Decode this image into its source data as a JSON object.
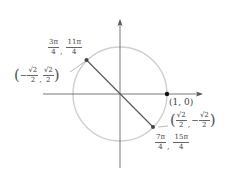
{
  "diagram": {
    "type": "unit-circle",
    "center_px": [
      120,
      94
    ],
    "radius_px": 47,
    "colors": {
      "axes": "#555555",
      "circle": "#cfcfcf",
      "chord": "#555555",
      "point": "#444444",
      "point_one_zero": "#111111"
    },
    "points": {
      "upper_left": {
        "angles": [
          {
            "num": "3π",
            "den": "4"
          },
          {
            "num": "11π",
            "den": "4"
          }
        ],
        "coords": {
          "x": {
            "sign": "−",
            "num": "√2",
            "den": "2"
          },
          "y": {
            "sign": "",
            "num": "√2",
            "den": "2"
          }
        }
      },
      "lower_right": {
        "angles": [
          {
            "num": "7π",
            "den": "4"
          },
          {
            "num": "15π",
            "den": "4"
          }
        ],
        "coords": {
          "x": {
            "sign": "",
            "num": "√2",
            "den": "2"
          },
          "y": {
            "sign": "−",
            "num": "√2",
            "den": "2"
          }
        }
      },
      "one_zero": {
        "label": "(1, 0)"
      }
    },
    "punct": {
      "open": "(",
      "close": ")",
      "comma": ","
    }
  }
}
